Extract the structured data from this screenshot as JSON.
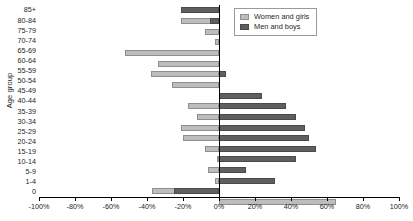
{
  "chart_data": {
    "type": "bar",
    "subtype": "population-pyramid",
    "title": "",
    "xlabel": "",
    "ylabel": "Age group",
    "categories": [
      "85+",
      "80-84",
      "75-79",
      "70-74",
      "65-69",
      "60-64",
      "55-59",
      "50-54",
      "45-49",
      "40-44",
      "35-39",
      "30-34",
      "25-29",
      "20-24",
      "15-19",
      "10-14",
      "5-9",
      "1-4",
      "0"
    ],
    "series": [
      {
        "name": "Women and girls",
        "color": "#bdbdbd",
        "values": [
          -1,
          -21,
          -8,
          -2,
          -52,
          -34,
          -38,
          -26,
          0,
          -17,
          -12,
          -21,
          -20,
          -8,
          -1,
          -6,
          -2,
          -37,
          0
        ]
      },
      {
        "name": "Men and boys",
        "color": "#5f5f5f",
        "values": [
          -21,
          -5,
          0,
          0,
          0,
          0,
          4,
          0,
          24,
          37,
          43,
          48,
          50,
          54,
          43,
          15,
          31,
          -25,
          0
        ]
      }
    ],
    "xticks": [
      -100,
      -80,
      -60,
      -40,
      -20,
      0,
      20,
      40,
      60,
      80,
      100
    ],
    "xticklabels": [
      "-100%",
      "-80%",
      "-60%",
      "-40%",
      "-20%",
      "0%",
      "20%",
      "40%",
      "60%",
      "80%",
      "100%"
    ],
    "xlim": [
      -100,
      100
    ],
    "grid": false,
    "legend_position": "top-right",
    "bottom_row_values": {
      "women": 65,
      "men": 0,
      "note": "row labelled 0 shows a long light bar to 65%"
    }
  },
  "legend": {
    "items": [
      {
        "label": "Women and girls",
        "swatch": "women-swatch"
      },
      {
        "label": "Men and boys",
        "swatch": "men-swatch"
      }
    ]
  },
  "axes": {
    "y_title": "Age group"
  }
}
